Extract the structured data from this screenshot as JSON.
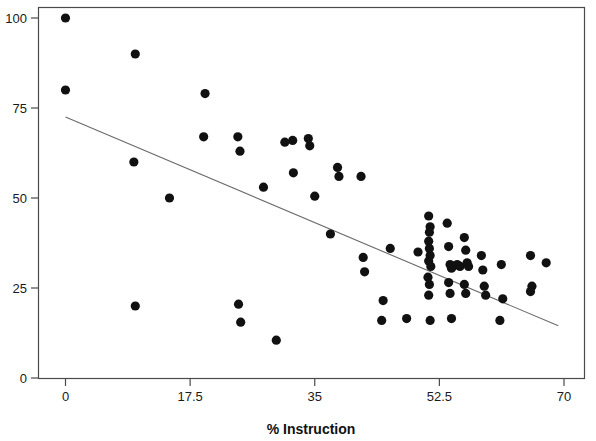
{
  "chart_data": {
    "type": "scatter",
    "title": "",
    "xlabel": "% Instruction",
    "ylabel": "",
    "xlim": [
      -2.6,
      72.0
    ],
    "ylim": [
      -2.0,
      103.0
    ],
    "xticks": [
      0,
      17.5,
      35,
      52.5,
      70
    ],
    "xtick_labels": [
      "0",
      "17.5",
      "35",
      "52.5",
      "70"
    ],
    "yticks": [
      0,
      25,
      50,
      75,
      100
    ],
    "ytick_labels": [
      "0",
      "25",
      "50",
      "75",
      "100"
    ],
    "grid": false,
    "legend": null,
    "marker": "filled-circle",
    "marker_color": "#111111",
    "points": [
      [
        0.0,
        100.0
      ],
      [
        0.0,
        80.0
      ],
      [
        9.8,
        90.0
      ],
      [
        9.6,
        60.0
      ],
      [
        9.8,
        20.0
      ],
      [
        14.6,
        50.0
      ],
      [
        19.6,
        79.0
      ],
      [
        19.4,
        67.0
      ],
      [
        24.2,
        67.0
      ],
      [
        24.5,
        63.0
      ],
      [
        24.3,
        20.5
      ],
      [
        24.6,
        15.5
      ],
      [
        27.8,
        53.0
      ],
      [
        31.9,
        66.0
      ],
      [
        34.1,
        66.5
      ],
      [
        34.3,
        64.5
      ],
      [
        30.8,
        65.5
      ],
      [
        29.6,
        10.5
      ],
      [
        32.0,
        57.0
      ],
      [
        35.0,
        50.5
      ],
      [
        38.2,
        58.5
      ],
      [
        38.4,
        56.0
      ],
      [
        41.5,
        56.0
      ],
      [
        37.2,
        40.0
      ],
      [
        41.8,
        33.5
      ],
      [
        42.0,
        29.5
      ],
      [
        44.6,
        21.5
      ],
      [
        44.4,
        16.0
      ],
      [
        47.9,
        16.5
      ],
      [
        45.6,
        36.0
      ],
      [
        49.5,
        35.0
      ],
      [
        51.0,
        45.0
      ],
      [
        51.2,
        42.0
      ],
      [
        51.1,
        40.5
      ],
      [
        51.0,
        38.0
      ],
      [
        51.1,
        36.0
      ],
      [
        51.2,
        34.0
      ],
      [
        51.0,
        32.5
      ],
      [
        51.3,
        31.0
      ],
      [
        50.9,
        28.0
      ],
      [
        51.1,
        26.0
      ],
      [
        51.0,
        23.0
      ],
      [
        51.2,
        16.0
      ],
      [
        53.6,
        43.0
      ],
      [
        53.8,
        36.5
      ],
      [
        54.0,
        31.5
      ],
      [
        54.2,
        30.5
      ],
      [
        54.4,
        31.0
      ],
      [
        55.0,
        31.5
      ],
      [
        55.4,
        31.0
      ],
      [
        56.0,
        39.0
      ],
      [
        56.2,
        35.5
      ],
      [
        56.4,
        32.0
      ],
      [
        56.6,
        31.0
      ],
      [
        56.0,
        26.0
      ],
      [
        56.2,
        23.5
      ],
      [
        53.8,
        26.5
      ],
      [
        54.0,
        23.5
      ],
      [
        54.2,
        16.5
      ],
      [
        58.4,
        34.0
      ],
      [
        58.6,
        30.0
      ],
      [
        58.8,
        25.5
      ],
      [
        59.0,
        23.0
      ],
      [
        61.2,
        31.5
      ],
      [
        61.4,
        22.0
      ],
      [
        61.0,
        16.0
      ],
      [
        65.3,
        34.0
      ],
      [
        65.5,
        25.5
      ],
      [
        65.3,
        24.0
      ],
      [
        67.5,
        32.0
      ]
    ],
    "trendline": {
      "x_start": 0.0,
      "y_start": 72.5,
      "x_end": 69.2,
      "y_end": 14.5,
      "color": "#6b6b6b",
      "style": "solid"
    }
  }
}
